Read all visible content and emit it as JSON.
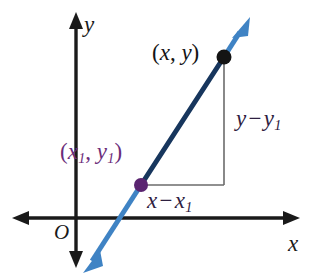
{
  "figure": {
    "width": 314,
    "height": 280,
    "background": "#ffffff"
  },
  "axes": {
    "x_label": "x",
    "y_label": "y",
    "origin_label": "O",
    "axis_color": "#1a1a1a",
    "origin_px": {
      "x": 76,
      "y": 218
    },
    "x_axis_from_px": {
      "x": 12,
      "y": 218
    },
    "x_axis_to_px": {
      "x": 300,
      "y": 218
    },
    "y_axis_from_px": {
      "x": 76,
      "y": 268
    },
    "y_axis_to_px": {
      "x": 76,
      "y": 12
    }
  },
  "line": {
    "color_ray": "#3f83c4",
    "color_segment": "#17365d",
    "arrow_tip_upper_px": {
      "x": 250,
      "y": 17
    },
    "arrow_tip_lower_px": {
      "x": 83,
      "y": 273
    }
  },
  "points": [
    {
      "name": "point-xy",
      "label": "(x, y)",
      "label_parts": {
        "open": "(",
        "first": "x",
        "sep": ", ",
        "second": "y",
        "close": ")"
      },
      "color": "#141414",
      "label_color": "#141414",
      "px": {
        "x": 224,
        "y": 57
      }
    },
    {
      "name": "point-x1y1",
      "label": "(x₁, y₁)",
      "label_parts": {
        "open": "(",
        "first": "x",
        "first_sub": "1",
        "sep": ", ",
        "second": "y",
        "second_sub": "1",
        "close": ")"
      },
      "color": "#6b2d7a",
      "label_color": "#6b2d7a",
      "px": {
        "x": 141,
        "y": 185
      }
    }
  ],
  "legs": {
    "rise": {
      "label": "y − y₁",
      "parts": {
        "first": "y",
        "op": "−",
        "second": "y",
        "second_sub": "1"
      },
      "color": "#2e2040",
      "line_color": "#6b6b6b",
      "from_px": {
        "x": 224,
        "y": 57
      },
      "to_px": {
        "x": 224,
        "y": 185
      }
    },
    "run": {
      "label": "x − x₁",
      "parts": {
        "first": "x",
        "op": "−",
        "second": "x",
        "second_sub": "1"
      },
      "color": "#2e2040",
      "line_color": "#6b6b6b",
      "from_px": {
        "x": 141,
        "y": 185
      },
      "to_px": {
        "x": 224,
        "y": 185
      }
    }
  },
  "colors": {
    "ray_blue": "#3f83c4",
    "segment_navy": "#17365d",
    "purple": "#6b2d7a",
    "black": "#1a1a1a",
    "gray_leg": "#6b6b6b"
  }
}
